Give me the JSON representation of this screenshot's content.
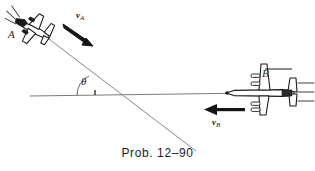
{
  "figure": {
    "caption": "Prob. 12–90",
    "background_color": "#ffffff",
    "ink_color": "#1a1a1a",
    "line_color": "#6e6e6e",
    "width": 315,
    "height": 171
  },
  "labels": {
    "plane_a": "A",
    "plane_b": "B",
    "velocity_a": "v",
    "velocity_a_sub": "A",
    "velocity_b": "v",
    "velocity_b_sub": "B",
    "angle": "θ"
  },
  "diagram": {
    "type": "free-body-kinematics-sketch",
    "objects": [
      {
        "name": "airplane-a",
        "label": "A",
        "heading_deg": 40,
        "position": [
          28,
          25
        ],
        "motion_lines": 3
      },
      {
        "name": "airplane-b",
        "label": "B",
        "heading_deg": 180,
        "position": [
          268,
          92
        ],
        "motion_lines": 3
      }
    ],
    "vectors": [
      {
        "name": "velocity-a-arrow",
        "label": "vA",
        "from": [
          63,
          24
        ],
        "to": [
          92,
          44
        ],
        "direction_deg": 34
      },
      {
        "name": "velocity-b-arrow",
        "label": "vB",
        "from": [
          244,
          110
        ],
        "to": [
          205,
          110
        ],
        "direction_deg": 180
      }
    ],
    "lines": [
      {
        "name": "horizontal-reference-line",
        "from": [
          30,
          96
        ],
        "to": [
          253,
          93
        ]
      },
      {
        "name": "flight-path-line-a",
        "from": [
          45,
          36
        ],
        "to": [
          196,
          151
        ]
      }
    ],
    "angle_marker": {
      "name": "theta-angle-arc",
      "vertex": [
        98,
        95
      ],
      "between": [
        "horizontal-reference-line",
        "flight-path-line-a"
      ],
      "symbol": "θ"
    }
  }
}
